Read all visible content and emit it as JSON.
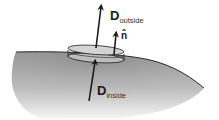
{
  "diagram": {
    "labels": {
      "d_outside": {
        "main": "D",
        "sub": "outside"
      },
      "d_inside": {
        "main": "D",
        "sub": "inside"
      },
      "normal": "n̂"
    },
    "colors": {
      "surface_top": "#8c8c8c",
      "surface_bottom": "#f2f2f2",
      "boundary_line": "#2a2a2a",
      "arrow": "#1a1a1a",
      "pillbox_fill": "#cfcfcf"
    }
  }
}
